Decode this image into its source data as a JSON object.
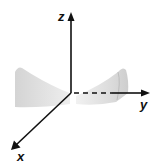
{
  "diagram": {
    "type": "3d-coordinate-axes",
    "axes": [
      {
        "name": "z",
        "label": "z",
        "direction": "up"
      },
      {
        "name": "y",
        "label": "y",
        "direction": "right"
      },
      {
        "name": "x",
        "label": "x",
        "direction": "down-left"
      }
    ],
    "surface": {
      "description": "translucent gray saddle-like surface lobes on both sides of the z-axis",
      "color": "#d9d9d9"
    },
    "colors": {
      "axis": "#111111",
      "surface": "#d9d9d9",
      "background": "#ffffff"
    }
  }
}
